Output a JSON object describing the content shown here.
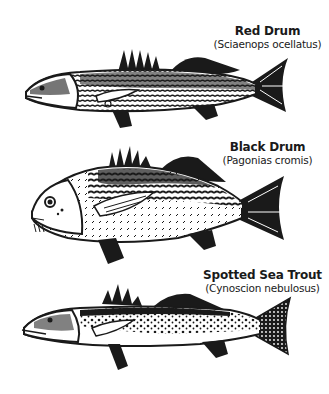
{
  "fish": [
    {
      "common_name": "Red Drum",
      "scientific_name": "(Sciaenops ocellatus)",
      "icon": "red-drum-fish-icon"
    },
    {
      "common_name": "Black Drum",
      "scientific_name": "(Pagonias cromis)",
      "icon": "black-drum-fish-icon"
    },
    {
      "common_name": "Spotted Sea Trout",
      "scientific_name": "(Cynoscion nebulosus)",
      "icon": "spotted-sea-trout-fish-icon"
    }
  ],
  "colors": {
    "ink": "#1a1a1a",
    "background": "#ffffff"
  }
}
